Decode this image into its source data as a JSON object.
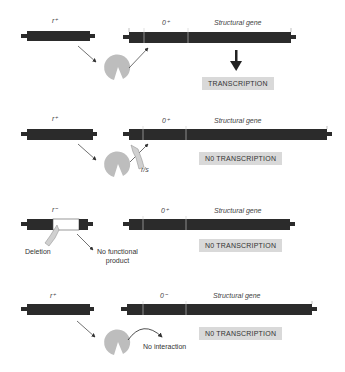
{
  "colors": {
    "dna": "#2b2b2b",
    "repressor": "#bdbdbd",
    "box": "#d9d9d9",
    "text": "#333333"
  },
  "panels": [
    {
      "regulator_label": "r⁺",
      "operator_label": "0⁺",
      "gene_label": "Structural gene",
      "result": "TRANSCRIPTION",
      "repressor": "active-repressor-binds-inducer"
    },
    {
      "regulator_label": "r⁺",
      "operator_label": "0⁺",
      "gene_label": "Structural gene",
      "result": "N0 TRANSCRIPTION",
      "mutation_label": "r/s"
    },
    {
      "regulator_label": "r⁻",
      "operator_label": "0⁺",
      "gene_label": "Structural gene",
      "result": "N0 TRANSCRIPTION",
      "deletion_label": "Deletion",
      "note_line1": "No functional",
      "note_line2": "product"
    },
    {
      "regulator_label": "r⁺",
      "operator_label": "0⁻",
      "gene_label": "Structural gene",
      "result": "N0 TRANSCRIPTION",
      "note": "No interaction"
    }
  ]
}
